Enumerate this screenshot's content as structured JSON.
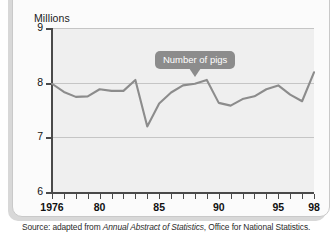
{
  "card": {
    "kind": "figure-card"
  },
  "chart_data": {
    "type": "line",
    "title": "",
    "xlabel": "",
    "ylabel": "Millions",
    "ylim": [
      6,
      9
    ],
    "xlim": [
      1976,
      1998
    ],
    "yticks": [
      "6",
      "7",
      "8",
      "9"
    ],
    "ytick_values": [
      6,
      7,
      8,
      9
    ],
    "gridlines": [
      7,
      8,
      9
    ],
    "grid": true,
    "legend": "none",
    "xtick_labels": [
      "1976",
      "80",
      "85",
      "90",
      "95",
      "98"
    ],
    "xtick_label_values": [
      1976,
      1980,
      1985,
      1990,
      1995,
      1998
    ],
    "series": [
      {
        "name": "Number of pigs",
        "x": [
          1976,
          1977,
          1978,
          1979,
          1980,
          1981,
          1982,
          1983,
          1984,
          1985,
          1986,
          1987,
          1988,
          1989,
          1990,
          1991,
          1992,
          1993,
          1994,
          1995,
          1996,
          1997,
          1998
        ],
        "values": [
          7.98,
          7.83,
          7.74,
          7.75,
          7.88,
          7.85,
          7.85,
          8.05,
          7.2,
          7.62,
          7.82,
          7.95,
          7.98,
          8.05,
          7.63,
          7.58,
          7.7,
          7.75,
          7.88,
          7.95,
          7.78,
          7.66,
          8.19
        ]
      }
    ],
    "annotations": [
      {
        "label": "Number of pigs",
        "points_to_year": 1988,
        "points_to_value": 8.05
      }
    ]
  },
  "source_note": {
    "prefix": "Source: adapted from ",
    "italic_title": "Annual Abstract of Statistics",
    "suffix": ", Office for National Statistics."
  },
  "colors": {
    "series_line": "#8c8c8c",
    "callout_bg": "#8c8c8c",
    "plot_bg": "#efefef",
    "grid": "#c5c5c5",
    "axis": "#4a4a4a"
  }
}
